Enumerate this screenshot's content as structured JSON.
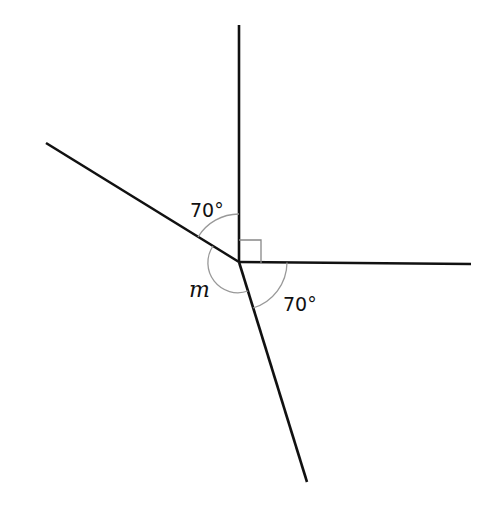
{
  "diagram": {
    "type": "angles-around-a-point",
    "vertex": {
      "x": 239,
      "y": 262
    },
    "rays": [
      {
        "name": "up",
        "end": {
          "x": 239,
          "y": 25
        }
      },
      {
        "name": "right",
        "end": {
          "x": 471,
          "y": 264
        }
      },
      {
        "name": "lower-right",
        "end": {
          "x": 307,
          "y": 482
        }
      },
      {
        "name": "upper-left",
        "end": {
          "x": 46,
          "y": 143
        }
      }
    ],
    "labels": {
      "angle_top_left": "70°",
      "angle_bottom_right": "70°",
      "angle_unknown": "m"
    },
    "right_angle_marker": true,
    "colors": {
      "line": "#111111",
      "arc": "#999999"
    }
  }
}
